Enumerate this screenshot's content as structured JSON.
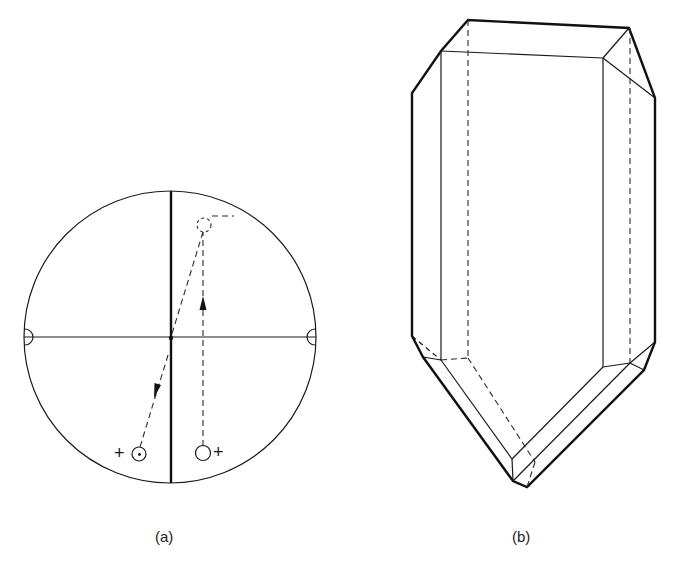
{
  "figure": {
    "panel_a": {
      "label": "(a)",
      "description": "stereogram",
      "symbols": {
        "plus_left": "+",
        "plus_right": "+"
      }
    },
    "panel_b": {
      "label": "(b)",
      "description": "crystal drawing"
    },
    "colors": {
      "line": "#111111",
      "background": "#ffffff"
    }
  }
}
